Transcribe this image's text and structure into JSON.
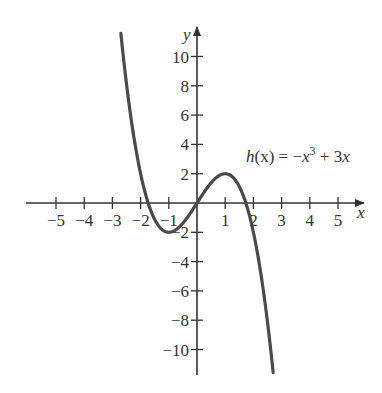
{
  "chart_data": {
    "type": "line",
    "title": "",
    "xlabel": "x",
    "ylabel": "y",
    "xlim": [
      -6,
      6
    ],
    "ylim": [
      -12,
      12
    ],
    "grid": false,
    "x_ticks": [
      -5,
      -4,
      -3,
      -2,
      -1,
      1,
      2,
      3,
      4,
      5
    ],
    "y_ticks": [
      -10,
      -8,
      -6,
      -4,
      -2,
      2,
      4,
      6,
      8,
      10
    ],
    "x_tick_labels": [
      "−5",
      "−4",
      "−3",
      "−2",
      "−1",
      "1",
      "2",
      "3",
      "4",
      "5"
    ],
    "y_tick_labels": [
      "−10",
      "−8",
      "−6",
      "−4",
      "−2",
      "2",
      "4",
      "6",
      "8",
      "10"
    ],
    "series": [
      {
        "name": "h(x) = −x³ + 3x",
        "expression": "-x^3 + 3x",
        "x": [
          -2.7,
          -2.5,
          -2,
          -1.5,
          -1,
          -0.5,
          0,
          0.5,
          1,
          1.5,
          2,
          2.5,
          2.7
        ],
        "y": [
          11.58,
          8.13,
          2,
          -1.13,
          -2,
          -1.38,
          0,
          1.38,
          2,
          1.13,
          -2,
          -8.13,
          -11.58
        ]
      }
    ],
    "annotations": [
      {
        "text": "h(x) = −x³ + 3x",
        "x": 1.6,
        "y": 3.1
      }
    ]
  },
  "labels": {
    "x_axis": "x",
    "y_axis": "y",
    "func_name": "h",
    "func_arg": "(x) = −",
    "func_var1": "x",
    "func_exp": "3",
    "func_rest": " + 3",
    "func_var2": "x"
  },
  "style": {
    "curve_color": "#4a4a4a",
    "axis_color": "#333333"
  }
}
